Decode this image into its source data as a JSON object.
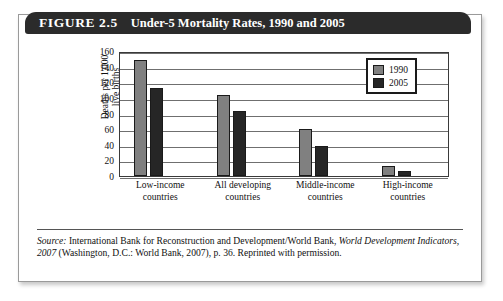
{
  "figure": {
    "number": "FIGURE 2.5",
    "title": "Under-5 Mortality Rates, 1990 and 2005"
  },
  "chart_data": {
    "type": "bar",
    "title": "Under-5 Mortality Rates, 1990 and 2005",
    "categories": [
      "Low-income countries",
      "All developing countries",
      "Middle-income countries",
      "High-income countries"
    ],
    "category_lines": [
      [
        "Low-income",
        "countries"
      ],
      [
        "All developing",
        "countries"
      ],
      [
        "Middle-income",
        "countries"
      ],
      [
        "High-income",
        "countries"
      ]
    ],
    "series": [
      {
        "name": "1990",
        "color": "#808080",
        "values": [
          148,
          104,
          60,
          13
        ]
      },
      {
        "name": "2005",
        "color": "#262626",
        "values": [
          113,
          83,
          38,
          7
        ]
      }
    ],
    "xlabel": "",
    "ylabel": "Deaths per 1,000 live births",
    "ylabel_lines": [
      "Deaths per 1,000",
      "live births"
    ],
    "ylim": [
      0,
      160
    ],
    "yticks": [
      0,
      20,
      40,
      60,
      80,
      100,
      120,
      140,
      160
    ],
    "grid": true,
    "legend_position": "top-right"
  },
  "source": {
    "label": "Source:",
    "text_1": " International Bank for Reconstruction and Development/World Bank, ",
    "italic_1": "World Development Indicators, 2007",
    "text_2": " (Washington, D.C.: World Bank, 2007), p. 36. Reprinted with permission."
  }
}
